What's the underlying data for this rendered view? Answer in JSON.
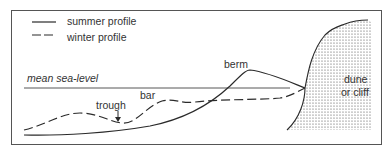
{
  "legend": {
    "summer": "summer profile",
    "winter": "winter profile"
  },
  "labels": {
    "sea_level": "mean sea-level",
    "trough": "trough",
    "bar": "bar",
    "berm": "berm",
    "dune_line1": "dune",
    "dune_line2": "or cliff"
  },
  "colors": {
    "line": "#2a2a2a",
    "frame": "#555555",
    "stipple": "#444444"
  }
}
